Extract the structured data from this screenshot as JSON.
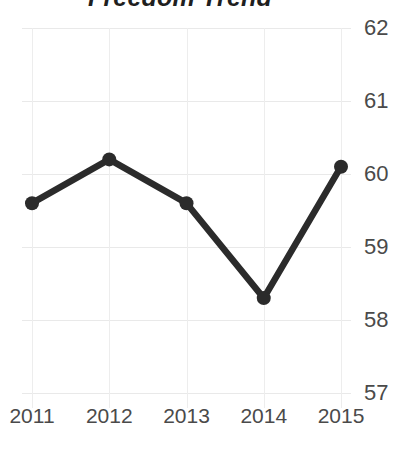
{
  "chart_data": {
    "type": "line",
    "title": "Freedom Trend",
    "xlabel": "",
    "ylabel": "",
    "categories": [
      "2011",
      "2012",
      "2013",
      "2014",
      "2015"
    ],
    "values": [
      59.6,
      60.2,
      59.6,
      58.3,
      60.1
    ],
    "series": [
      {
        "name": "Freedom",
        "values": [
          59.6,
          60.2,
          59.6,
          58.3,
          60.1
        ]
      }
    ],
    "ylim": [
      57,
      62
    ],
    "yticks": [
      62,
      61,
      60,
      59,
      58,
      57
    ],
    "xticks": [
      "2011",
      "2012",
      "2013",
      "2014",
      "2015"
    ],
    "grid": true,
    "legend": false,
    "legend_position": "none",
    "y_axis_side": "right",
    "line_color": "#2b2b2b",
    "marker_color": "#2b2b2b",
    "grid_color": "#e9e9e9",
    "tick_label_color": "#4a4a4a",
    "title_color": "#1f1f1f",
    "background_color": "#ffffff"
  }
}
